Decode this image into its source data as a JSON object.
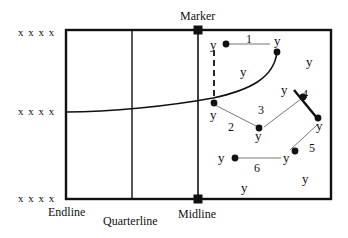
{
  "diagram": {
    "type": "court-drill",
    "labels": {
      "marker": "Marker",
      "midline": "Midline",
      "endline": "Endline",
      "quarterline": "Quarterline"
    },
    "attackers": {
      "symbol": "x x x x",
      "rows": [
        "x x x x",
        "x x x x",
        "x x x x"
      ]
    },
    "defender_symbol": "y",
    "pass_numbers": [
      "1",
      "2",
      "3",
      "4",
      "5",
      "6"
    ],
    "colors": {
      "line": "#111111",
      "thin_line": "#777777",
      "background": "#ffffff"
    }
  }
}
